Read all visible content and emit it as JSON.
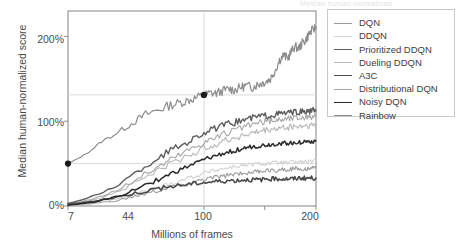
{
  "ghost_header": "Median human-normalized",
  "axes": {
    "ylabel": "Median human-normalized score",
    "xlabel": "Millions of frames",
    "yticks": [
      "0%",
      "100%",
      "200%"
    ],
    "xticks": [
      "7",
      "44",
      "100",
      "200"
    ]
  },
  "legend": {
    "items": [
      {
        "label": "DQN",
        "color": "#9a9a9a",
        "width": 1.1
      },
      {
        "label": "DDQN",
        "color": "#d2d2d2",
        "width": 1.1
      },
      {
        "label": "Prioritized DDQN",
        "color": "#5e5e5e",
        "width": 1.4
      },
      {
        "label": "Dueling DDQN",
        "color": "#b8b8b8",
        "width": 1.1
      },
      {
        "label": "A3C",
        "color": "#4a4a4a",
        "width": 1.6
      },
      {
        "label": "Distributional DQN",
        "color": "#a8a8a8",
        "width": 1.1
      },
      {
        "label": "Noisy DQN",
        "color": "#2a2a2a",
        "width": 1.5
      },
      {
        "label": "Rainbow",
        "color": "#8c8c8c",
        "width": 1.2
      }
    ]
  },
  "chart_data": {
    "type": "line",
    "title": "",
    "xlabel": "Millions of frames",
    "ylabel": "Median human-normalized score",
    "xscale": "log",
    "xlim": [
      7,
      200
    ],
    "ylim": [
      0,
      230
    ],
    "xticks": [
      7,
      44,
      100,
      200
    ],
    "yticks": [
      0,
      100,
      200
    ],
    "grid": false,
    "legend_position": "right-outside",
    "annotations": [
      {
        "type": "marker-dot",
        "x": 7,
        "y": 50,
        "series": "Rainbow",
        "note": "dot at 7M frames, ~50%"
      },
      {
        "type": "marker-dot",
        "x": 44,
        "y": 131,
        "series": "Rainbow",
        "note": "dot at 44M frames, ~131%"
      },
      {
        "type": "hline",
        "y": 50,
        "note": "faint reference line at 50%"
      },
      {
        "type": "hline",
        "y": 131,
        "note": "faint reference line at 131%"
      },
      {
        "type": "vline",
        "x": 44,
        "note": "faint reference line at 44M frames"
      }
    ],
    "series": [
      {
        "name": "Rainbow",
        "color": "#8c8c8c",
        "x": [
          7,
          9,
          11,
          14,
          17,
          20,
          24,
          28,
          32,
          36,
          40,
          44,
          48,
          52,
          57,
          62,
          67,
          72,
          78,
          84,
          90,
          96,
          102,
          108,
          115,
          122,
          129,
          136,
          143,
          150,
          158,
          166,
          174,
          182,
          190,
          200
        ],
        "values": [
          50,
          62,
          76,
          88,
          99,
          108,
          114,
          119,
          122,
          125,
          128,
          131,
          133,
          133,
          136,
          138,
          137,
          140,
          142,
          140,
          143,
          145,
          147,
          150,
          160,
          172,
          178,
          174,
          182,
          188,
          186,
          192,
          196,
          203,
          207,
          211
        ]
      },
      {
        "name": "Prioritized DDQN",
        "color": "#5e5e5e",
        "x": [
          7,
          10,
          14,
          18,
          23,
          28,
          34,
          40,
          46,
          53,
          60,
          68,
          76,
          85,
          94,
          104,
          114,
          125,
          136,
          148,
          160,
          173,
          186,
          200
        ],
        "values": [
          3,
          12,
          26,
          41,
          55,
          66,
          74,
          82,
          88,
          92,
          96,
          99,
          102,
          104,
          106,
          107,
          108,
          109,
          110,
          110,
          111,
          111,
          112,
          112
        ]
      },
      {
        "name": "Distributional DQN",
        "color": "#a8a8a8",
        "x": [
          7,
          10,
          14,
          18,
          23,
          28,
          34,
          40,
          46,
          53,
          60,
          68,
          76,
          85,
          94,
          104,
          114,
          125,
          136,
          148,
          160,
          173,
          186,
          200
        ],
        "values": [
          2,
          9,
          20,
          33,
          45,
          55,
          64,
          71,
          77,
          82,
          86,
          90,
          93,
          96,
          98,
          100,
          101,
          102,
          103,
          104,
          104,
          105,
          105,
          106
        ]
      },
      {
        "name": "Dueling DDQN",
        "color": "#b8b8b8",
        "x": [
          7,
          10,
          14,
          18,
          23,
          28,
          34,
          40,
          46,
          53,
          60,
          68,
          76,
          85,
          94,
          104,
          114,
          125,
          136,
          148,
          160,
          173,
          186,
          200
        ],
        "values": [
          2,
          8,
          18,
          30,
          41,
          50,
          58,
          64,
          70,
          74,
          78,
          81,
          84,
          86,
          88,
          90,
          91,
          92,
          93,
          94,
          94,
          95,
          95,
          96
        ]
      },
      {
        "name": "Noisy DQN",
        "color": "#2a2a2a",
        "x": [
          7,
          10,
          14,
          18,
          23,
          28,
          34,
          40,
          46,
          53,
          60,
          68,
          76,
          85,
          94,
          104,
          114,
          125,
          136,
          148,
          160,
          173,
          186,
          200
        ],
        "values": [
          1,
          5,
          12,
          21,
          30,
          38,
          45,
          51,
          56,
          60,
          63,
          66,
          68,
          70,
          71,
          72,
          73,
          74,
          74,
          75,
          75,
          76,
          76,
          77
        ]
      },
      {
        "name": "DQN",
        "color": "#9a9a9a",
        "x": [
          7,
          10,
          14,
          18,
          23,
          28,
          34,
          40,
          46,
          53,
          60,
          68,
          76,
          85,
          94,
          104,
          114,
          125,
          136,
          148,
          160,
          173,
          186,
          200
        ],
        "values": [
          1,
          3,
          7,
          12,
          17,
          22,
          26,
          29,
          32,
          34,
          36,
          38,
          39,
          40,
          41,
          42,
          42,
          43,
          43,
          44,
          44,
          44,
          45,
          45
        ]
      },
      {
        "name": "DDQN",
        "color": "#d2d2d2",
        "x": [
          7,
          10,
          14,
          18,
          23,
          28,
          34,
          40,
          46,
          53,
          60,
          68,
          76,
          85,
          94,
          104,
          114,
          125,
          136,
          148,
          160,
          173,
          186,
          200
        ],
        "values": [
          1,
          4,
          9,
          15,
          21,
          27,
          32,
          36,
          40,
          43,
          45,
          47,
          48,
          49,
          50,
          50,
          51,
          51,
          51,
          52,
          52,
          52,
          52,
          53
        ]
      },
      {
        "name": "A3C",
        "color": "#4a4a4a",
        "x": [
          7,
          10,
          14,
          18,
          23,
          28,
          34,
          40,
          46,
          53,
          60,
          68,
          76,
          85,
          94,
          104,
          114,
          125,
          136,
          148,
          160,
          173,
          186,
          200
        ],
        "values": [
          2,
          6,
          11,
          16,
          20,
          23,
          25,
          27,
          28,
          29,
          30,
          30,
          31,
          31,
          31,
          32,
          32,
          32,
          32,
          32,
          33,
          33,
          33,
          33
        ]
      }
    ]
  }
}
